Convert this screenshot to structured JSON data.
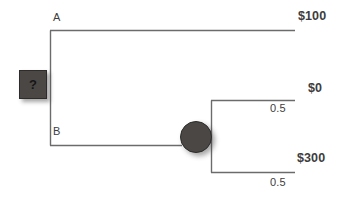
{
  "diagram": {
    "type": "decision-tree",
    "title": "",
    "background_color": "#ffffff",
    "line_color": "#6b6b6b",
    "node_fill_color": "#4a4745",
    "text_color": "#3d3d3d"
  },
  "nodes": {
    "decision": {
      "kind": "decision",
      "shape": "square",
      "label": "?",
      "x": 32,
      "y": 83
    },
    "chance": {
      "kind": "chance",
      "shape": "circle",
      "label": "",
      "x": 195,
      "y": 136
    }
  },
  "branches": [
    {
      "id": "branch-a",
      "label": "A",
      "from": "decision",
      "payoff": "$100",
      "probability": ""
    },
    {
      "id": "branch-b",
      "label": "B",
      "from": "decision",
      "payoff": "",
      "probability": ""
    },
    {
      "id": "chance-up",
      "label": "",
      "from": "chance",
      "payoff": "$0",
      "probability": "0.5"
    },
    {
      "id": "chance-down",
      "label": "",
      "from": "chance",
      "payoff": "$300",
      "probability": "0.5"
    }
  ],
  "labels": {
    "branch_a": "A",
    "branch_b": "B",
    "payoff_100": "$100",
    "payoff_0": "$0",
    "payoff_300": "$300",
    "prob_upper": "0.5",
    "prob_lower": "0.5",
    "decision_mark": "?"
  }
}
